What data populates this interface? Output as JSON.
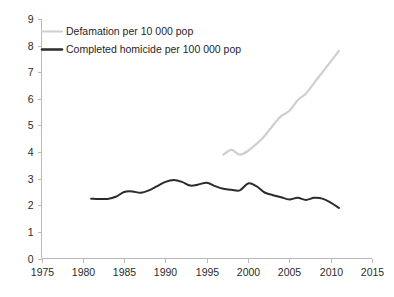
{
  "chart_data": {
    "type": "line",
    "title": "",
    "subtitle": "",
    "xlabel": "",
    "ylabel": "",
    "xlim": [
      1975,
      2015
    ],
    "ylim": [
      0,
      9
    ],
    "x_ticks": [
      1975,
      1980,
      1985,
      1990,
      1995,
      2000,
      2005,
      2010,
      2015
    ],
    "y_ticks": [
      0,
      1,
      2,
      3,
      4,
      5,
      6,
      7,
      8,
      9
    ],
    "grid": false,
    "legend_position": "top-left-inside",
    "background_color": "#ffffff",
    "axis_color": "#b9b9b9",
    "series": [
      {
        "name": "Defamation per 10 000 pop",
        "color": "#cfcfcf",
        "line_width": 2.2,
        "x": [
          1997,
          1998,
          1999,
          2000,
          2001,
          2002,
          2003,
          2004,
          2005,
          2006,
          2007,
          2008,
          2009,
          2010,
          2011
        ],
        "values": [
          3.9,
          4.08,
          3.9,
          4.05,
          4.3,
          4.6,
          5.0,
          5.35,
          5.55,
          5.95,
          6.2,
          6.6,
          7.0,
          7.4,
          7.8
        ]
      },
      {
        "name": "Completed homicide per 100 000 pop",
        "color": "#2b2b2b",
        "line_width": 2.0,
        "x": [
          1981,
          1982,
          1983,
          1984,
          1985,
          1986,
          1987,
          1988,
          1989,
          1990,
          1991,
          1992,
          1993,
          1994,
          1995,
          1996,
          1997,
          1998,
          1999,
          2000,
          2001,
          2002,
          2003,
          2004,
          2005,
          2006,
          2007,
          2008,
          2009,
          2010,
          2011
        ],
        "values": [
          2.25,
          2.24,
          2.24,
          2.32,
          2.5,
          2.52,
          2.47,
          2.56,
          2.72,
          2.88,
          2.95,
          2.88,
          2.74,
          2.78,
          2.85,
          2.72,
          2.62,
          2.58,
          2.56,
          2.82,
          2.72,
          2.48,
          2.38,
          2.3,
          2.22,
          2.28,
          2.2,
          2.28,
          2.25,
          2.1,
          1.9
        ]
      }
    ]
  },
  "legend": {
    "items": [
      {
        "label": "Defamation per 10 000 pop",
        "swatch": "gray-line-swatch"
      },
      {
        "label": "Completed homicide per 100 000 pop",
        "swatch": "black-line-swatch"
      }
    ]
  },
  "axes": {
    "y_tick_labels": [
      "9",
      "8",
      "7",
      "6",
      "5",
      "4",
      "3",
      "2",
      "1",
      "0"
    ],
    "x_tick_labels": [
      "1975",
      "1980",
      "1985",
      "1990",
      "1995",
      "2000",
      "2005",
      "2010",
      "2015"
    ]
  }
}
